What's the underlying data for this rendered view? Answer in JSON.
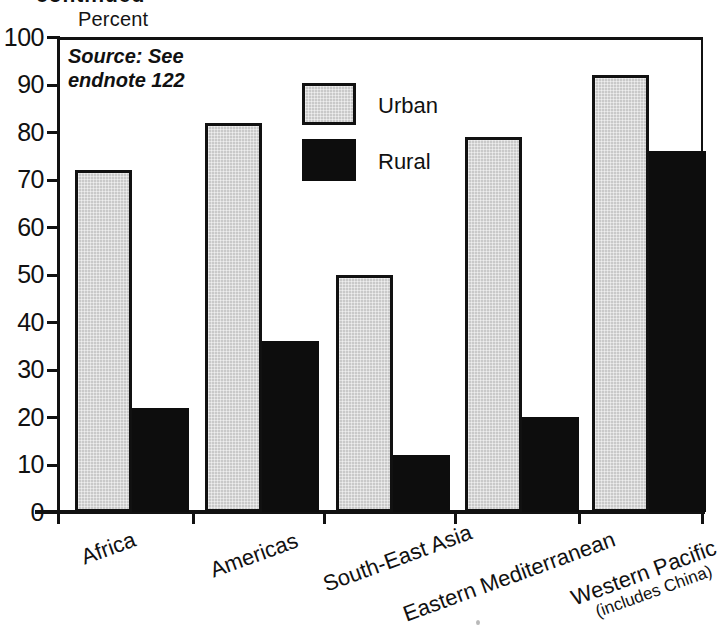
{
  "figure": {
    "clipped_heading": "continued",
    "axis_title": "Percent",
    "source_note": "Source: See\nendnote 122"
  },
  "legend": {
    "position": "inside-top-center",
    "entries": [
      {
        "label": "Urban",
        "color": "#c9c9c9",
        "swatch": "urban-swatch"
      },
      {
        "label": "Rural",
        "color": "#0d0d0d",
        "swatch": "rural-swatch"
      }
    ]
  },
  "chart_data": {
    "type": "bar",
    "title": "",
    "subtitle": "",
    "xlabel": "",
    "ylabel": "Percent",
    "ylim": [
      0,
      100
    ],
    "yticks": [
      0,
      10,
      20,
      30,
      40,
      50,
      60,
      70,
      80,
      90,
      100
    ],
    "ytick_labels": [
      "0",
      "10",
      "20",
      "30",
      "40",
      "50",
      "60",
      "70",
      "80",
      "90",
      "100"
    ],
    "grid": false,
    "legend_position": "upper center (inside axes)",
    "annotation": "Source: See endnote 122",
    "categories": [
      "Africa",
      "Americas",
      "South-East Asia",
      "Eastern Mediterranean",
      "Western Pacific"
    ],
    "category_sublabels": [
      "",
      "",
      "",
      "",
      "(includes China)"
    ],
    "series": [
      {
        "name": "Urban",
        "color": "#c9c9c9",
        "values": [
          72,
          82,
          50,
          79,
          92
        ]
      },
      {
        "name": "Rural",
        "color": "#0d0d0d",
        "values": [
          22,
          36,
          12,
          20,
          76
        ]
      }
    ]
  }
}
